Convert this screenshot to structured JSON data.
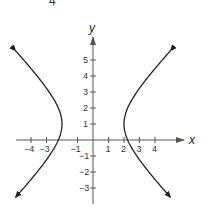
{
  "header": {
    "partial_left": "r",
    "partial_number": "4"
  },
  "chart_data": {
    "type": "line",
    "title": "",
    "equation": "x^2/4 - (y-1)^2/4 = 1",
    "xlabel": "x",
    "ylabel": "y",
    "xlim": [
      -5,
      6
    ],
    "ylim": [
      -4,
      6.5
    ],
    "grid": false,
    "legend": null,
    "x_ticks": [
      -4,
      -3,
      -1,
      1,
      2,
      3,
      4
    ],
    "x_tick_labels": [
      "−4",
      "−3",
      "−1",
      "1",
      "2",
      "3",
      "4"
    ],
    "y_ticks": [
      5,
      4,
      3,
      2,
      1,
      -1,
      -2,
      -3
    ],
    "y_tick_labels": [
      "5",
      "4",
      "3",
      "2",
      "1",
      "−1",
      "−2",
      "−3"
    ],
    "series": [
      {
        "name": "right branch",
        "x": [
          5.0,
          4.0,
          3.0,
          2.5,
          2.2,
          2.0,
          2.2,
          2.5,
          3.0,
          4.0,
          5.0
        ],
        "y": [
          5.58,
          4.46,
          3.24,
          2.5,
          1.92,
          1.0,
          0.08,
          -0.5,
          -1.24,
          -2.46,
          -3.58
        ]
      },
      {
        "name": "left branch",
        "x": [
          -5.0,
          -4.0,
          -3.0,
          -2.5,
          -2.2,
          -2.0,
          -2.2,
          -2.5,
          -3.0,
          -4.0,
          -5.0
        ],
        "y": [
          5.58,
          4.46,
          3.24,
          2.5,
          1.92,
          1.0,
          0.08,
          -0.5,
          -1.24,
          -2.46,
          -3.58
        ]
      }
    ],
    "vertices": [
      [
        -2,
        1
      ],
      [
        2,
        1
      ]
    ],
    "x_intercepts": [
      -2.24,
      2.24
    ],
    "colors": {
      "curve": "#222222",
      "axis": "#555555",
      "text": "#333333"
    }
  }
}
